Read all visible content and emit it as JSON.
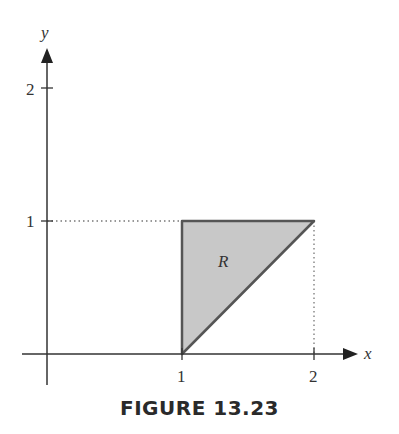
{
  "figure": {
    "caption": "FIGURE 13.23",
    "axes": {
      "x_label": "x",
      "y_label": "y",
      "x_ticks": [
        "1",
        "2"
      ],
      "y_ticks": [
        "1",
        "2"
      ]
    },
    "region": {
      "label": "R",
      "vertices": [
        [
          1,
          0
        ],
        [
          1,
          1
        ],
        [
          2,
          1
        ]
      ],
      "fill_color": "#c8c8c8",
      "edge_color": "#555555"
    },
    "guides": [
      {
        "from": [
          0,
          1
        ],
        "to": [
          1,
          1
        ],
        "style": "dotted"
      },
      {
        "from": [
          2,
          0
        ],
        "to": [
          2,
          1
        ],
        "style": "dotted"
      }
    ]
  }
}
